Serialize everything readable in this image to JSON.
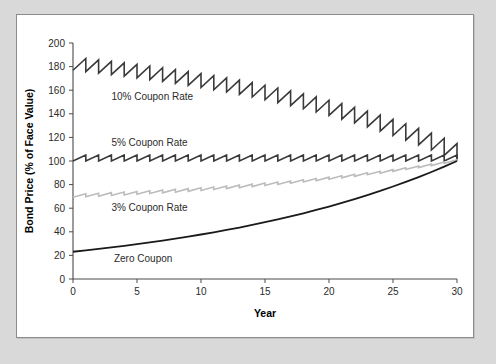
{
  "figure": {
    "panel_background": "#ffffff",
    "outer_background": "#d9d9d9",
    "border_color": "#8c8c8c"
  },
  "chart_data": {
    "type": "line",
    "title": "",
    "subtitle": "",
    "xlabel": "Year",
    "ylabel": "Bond Price (% of Face Value)",
    "xlim": [
      0,
      30
    ],
    "ylim": [
      0,
      200
    ],
    "xticks": [
      0,
      5,
      10,
      15,
      20,
      25,
      30
    ],
    "xtick_labels": [
      "0",
      "5",
      "10",
      "15",
      "20",
      "25",
      "30"
    ],
    "yticks": [
      0,
      20,
      40,
      60,
      80,
      100,
      120,
      140,
      160,
      180,
      200
    ],
    "ytick_labels": [
      "0",
      "20",
      "40",
      "60",
      "80",
      "100",
      "120",
      "140",
      "160",
      "180",
      "200"
    ],
    "grid": false,
    "legend_position": "inline-annotations",
    "yield_to_maturity_percent": 5,
    "par_value_percent": 100,
    "maturity_years": 30,
    "series": [
      {
        "name": "10% Coupon Rate",
        "color": "#3a3a3a",
        "line_width": 1.6,
        "pattern": "sawtooth",
        "coupon_rate_percent": 10,
        "label": "10% Coupon Rate",
        "label_x_year": 3.0,
        "label_y_value": 152,
        "x": [
          0,
          1,
          2,
          3,
          4,
          5,
          6,
          7,
          8,
          9,
          10,
          11,
          12,
          13,
          14,
          15,
          16,
          17,
          18,
          19,
          20,
          21,
          22,
          23,
          24,
          25,
          26,
          27,
          28,
          29,
          30
        ],
        "values": [
          176.9,
          175.7,
          174.5,
          173.2,
          171.9,
          170.5,
          169.0,
          167.5,
          165.8,
          164.1,
          162.3,
          160.4,
          158.5,
          156.4,
          154.2,
          151.9,
          149.5,
          146.9,
          144.3,
          141.5,
          138.6,
          135.5,
          132.3,
          128.9,
          125.3,
          121.6,
          117.7,
          113.6,
          109.3,
          104.8,
          100.0
        ]
      },
      {
        "name": "5% Coupon Rate",
        "color": "#3a3a3a",
        "line_width": 1.6,
        "pattern": "sawtooth",
        "coupon_rate_percent": 5,
        "label": "5% Coupon Rate",
        "label_x_year": 3.0,
        "label_y_value": 113,
        "x": [
          0,
          1,
          2,
          3,
          4,
          5,
          6,
          7,
          8,
          9,
          10,
          11,
          12,
          13,
          14,
          15,
          16,
          17,
          18,
          19,
          20,
          21,
          22,
          23,
          24,
          25,
          26,
          27,
          28,
          29,
          30
        ],
        "values": [
          100.0,
          100.0,
          100.0,
          100.0,
          100.0,
          100.0,
          100.0,
          100.0,
          100.0,
          100.0,
          100.0,
          100.0,
          100.0,
          100.0,
          100.0,
          100.0,
          100.0,
          100.0,
          100.0,
          100.0,
          100.0,
          100.0,
          100.0,
          100.0,
          100.0,
          100.0,
          100.0,
          100.0,
          100.0,
          100.0,
          100.0
        ]
      },
      {
        "name": "3% Coupon Rate",
        "color": "#bcbcbc",
        "line_width": 1.6,
        "pattern": "sawtooth",
        "coupon_rate_percent": 3,
        "label": "3% Coupon Rate",
        "label_x_year": 3.0,
        "label_y_value": 58,
        "x": [
          0,
          1,
          2,
          3,
          4,
          5,
          6,
          7,
          8,
          9,
          10,
          11,
          12,
          13,
          14,
          15,
          16,
          17,
          18,
          19,
          20,
          21,
          22,
          23,
          24,
          25,
          26,
          27,
          28,
          29,
          30
        ],
        "values": [
          69.2,
          69.7,
          70.2,
          70.7,
          71.2,
          71.8,
          72.4,
          73.0,
          73.6,
          74.3,
          75.0,
          75.8,
          76.6,
          77.4,
          78.3,
          79.2,
          80.1,
          81.1,
          82.2,
          83.3,
          84.5,
          85.7,
          87.0,
          88.3,
          89.7,
          91.2,
          92.8,
          94.4,
          96.1,
          98.0,
          100.0
        ]
      },
      {
        "name": "Zero Coupon",
        "color": "#1a1a1a",
        "line_width": 1.8,
        "pattern": "smooth",
        "coupon_rate_percent": 0,
        "label": "Zero Coupon",
        "label_x_year": 3.2,
        "label_y_value": 14,
        "x": [
          0,
          1,
          2,
          3,
          4,
          5,
          6,
          7,
          8,
          9,
          10,
          11,
          12,
          13,
          14,
          15,
          16,
          17,
          18,
          19,
          20,
          21,
          22,
          23,
          24,
          25,
          26,
          27,
          28,
          29,
          30
        ],
        "values": [
          23.1,
          24.3,
          25.5,
          26.8,
          28.1,
          29.5,
          31.0,
          32.6,
          34.2,
          35.9,
          37.7,
          39.6,
          41.6,
          43.6,
          45.8,
          48.1,
          50.5,
          53.0,
          55.7,
          58.5,
          61.4,
          64.5,
          67.7,
          71.1,
          74.6,
          78.4,
          82.3,
          86.4,
          90.7,
          95.2,
          100.0
        ]
      }
    ]
  }
}
